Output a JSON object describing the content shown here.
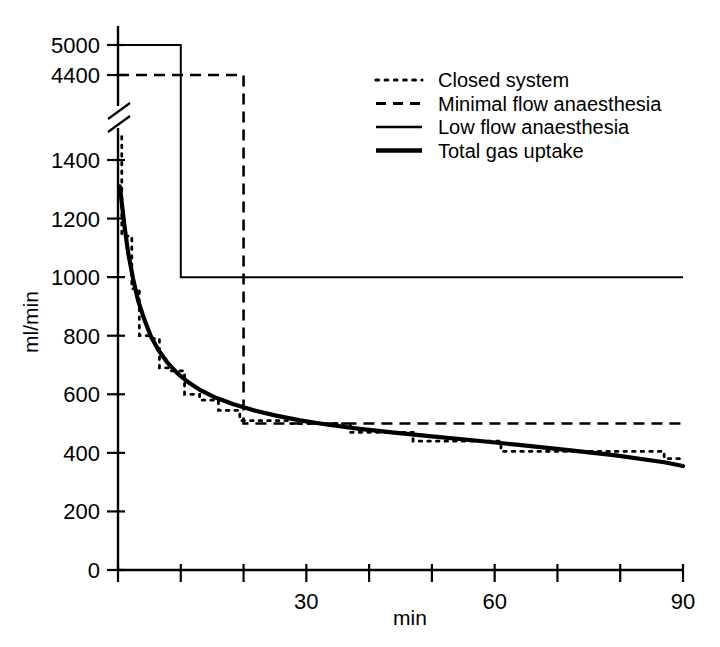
{
  "chart_data": {
    "type": "line",
    "title": "",
    "xlabel": "min",
    "ylabel": "ml/min",
    "xlim": [
      0,
      90
    ],
    "ylim": [
      0,
      1500
    ],
    "grid": false,
    "axis_break": {
      "present": true,
      "below_value": 1500,
      "above_value": 4200,
      "note": "y-axis broken between 1400 and 4400"
    },
    "x_ticks": [
      0,
      10,
      20,
      30,
      40,
      50,
      60,
      70,
      80,
      90
    ],
    "x_tick_labels": [
      "",
      "",
      "",
      "30",
      "",
      "",
      "60",
      "",
      "",
      "90"
    ],
    "y_ticks_lower": [
      0,
      200,
      400,
      600,
      800,
      1000,
      1200,
      1400
    ],
    "y_tick_labels_lower": [
      "0",
      "200",
      "400",
      "600",
      "800",
      "1000",
      "1200",
      "1400"
    ],
    "y_ticks_upper": [
      4400,
      5000
    ],
    "y_tick_labels_upper": [
      "4400",
      "5000"
    ],
    "legend_position": "top-right",
    "series": [
      {
        "name": "Closed system",
        "style": "dotted",
        "x": [
          0.6,
          0.6,
          2.2,
          2.2,
          3.4,
          3.4,
          5.0,
          5.0,
          6.6,
          6.6,
          8.4,
          8.4,
          10.6,
          10.6,
          13.0,
          13.0,
          16.0,
          16.0,
          19.4,
          19.4,
          27.0,
          27.0,
          37.0,
          37.0,
          47.0,
          47.0,
          61.0,
          61.0,
          87.0,
          87.0,
          90.0
        ],
        "y": [
          1480,
          1140,
          1140,
          960,
          960,
          800,
          800,
          790,
          790,
          690,
          690,
          680,
          680,
          600,
          600,
          580,
          580,
          545,
          545,
          510,
          510,
          500,
          500,
          470,
          470,
          440,
          440,
          405,
          405,
          380,
          380
        ]
      },
      {
        "name": "Minimal flow anaesthesia",
        "style": "dashed",
        "x": [
          0,
          20,
          20,
          90
        ],
        "y": [
          4400,
          4400,
          500,
          500
        ]
      },
      {
        "name": "Low flow anaesthesia",
        "style": "solid-thin",
        "x": [
          0,
          10,
          10,
          90
        ],
        "y": [
          5000,
          5000,
          1000,
          1000
        ]
      },
      {
        "name": "Total gas uptake",
        "style": "solid-thick",
        "x": [
          0.3,
          1.0,
          1.6,
          2.4,
          3.2,
          4.2,
          5.2,
          6.4,
          7.8,
          9.4,
          11.2,
          13.2,
          15.6,
          18.4,
          21.5,
          25.0,
          29.0,
          33.5,
          38.5,
          44.0,
          50.0,
          56.5,
          63.5,
          71.0,
          79.0,
          87.0,
          90.0
        ],
        "y": [
          1310,
          1180,
          1085,
          995,
          920,
          855,
          800,
          752,
          710,
          673,
          641,
          613,
          588,
          566,
          546,
          528,
          511,
          496,
          482,
          469,
          456,
          443,
          428,
          411,
          392,
          368,
          355
        ]
      }
    ]
  },
  "legend": {
    "items": [
      {
        "label": "Closed system",
        "marker": "dotted-line-icon"
      },
      {
        "label": "Minimal flow anaesthesia",
        "marker": "dashed-line-icon"
      },
      {
        "label": "Low flow anaesthesia",
        "marker": "thin-line-icon"
      },
      {
        "label": "Total gas uptake",
        "marker": "thick-line-icon"
      }
    ]
  },
  "colors": {
    "ink": "#000000",
    "background": "#ffffff"
  }
}
